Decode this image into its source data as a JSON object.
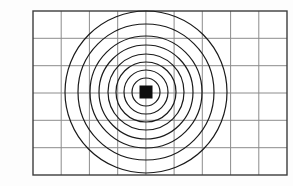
{
  "figure": {
    "background_color": "#fdfdfd",
    "width": 293,
    "height": 186
  },
  "chart_data": {
    "type": "scatter",
    "title": "",
    "subtitle": "",
    "xlabel": "",
    "ylabel": "",
    "grid": true,
    "legend": "none",
    "xlim": [
      0,
      9
    ],
    "ylim": [
      0,
      6
    ],
    "plot_area": {
      "left": 33,
      "top": 11,
      "right": 287,
      "bottom": 175,
      "columns": 9,
      "rows": 6,
      "cell_width": 28.2,
      "cell_height": 27.3
    },
    "grid_x_ticks": [
      33,
      61.2,
      89.4,
      117.7,
      145.9,
      174.1,
      202.3,
      230.6,
      258.8,
      287
    ],
    "grid_y_ticks": [
      11,
      38.3,
      65.7,
      93,
      120.3,
      147.7,
      175
    ],
    "center": {
      "x": 146,
      "y": 92
    },
    "marker": {
      "shape": "square",
      "size": 13,
      "color": "#0d0d0d",
      "label": "center-source-marker"
    },
    "series": [
      {
        "name": "contour-rings",
        "shape": "circle",
        "color": "#1a1a1a",
        "fill": "none",
        "values": [
          14,
          22,
          30,
          38,
          47,
          56,
          68,
          81
        ]
      }
    ],
    "annotations": []
  },
  "colors": {
    "border": "#3d3d3d",
    "grid_line": "#8c8c8c",
    "ring_stroke": "#1a1a1a",
    "marker_fill": "#0d0d0d",
    "page_background": "#fdfdfd"
  },
  "strokes": {
    "border_width": 1.4,
    "grid_width": 1.0,
    "ring_width": 1.2
  }
}
